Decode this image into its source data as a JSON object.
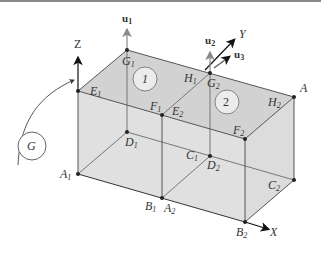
{
  "diagram": {
    "type": "3D box with two cells and coordinate axes",
    "axes": {
      "x": "X",
      "y": "Y",
      "z": "Z"
    },
    "vectors": {
      "u1": "u",
      "u1_sub": "1",
      "u2": "u",
      "u2_sub": "2",
      "u3": "u",
      "u3_sub": "3"
    },
    "rotation_label": "G",
    "cells": [
      "1",
      "2"
    ],
    "points": {
      "A": {
        "main": "A",
        "sub": ""
      },
      "A1": {
        "main": "A",
        "sub": "1"
      },
      "A2": {
        "main": "A",
        "sub": "2"
      },
      "B1": {
        "main": "B",
        "sub": "1"
      },
      "B2": {
        "main": "B",
        "sub": "2"
      },
      "C1": {
        "main": "C",
        "sub": "1"
      },
      "C2": {
        "main": "C",
        "sub": "2"
      },
      "D1": {
        "main": "D",
        "sub": "1"
      },
      "D2": {
        "main": "D",
        "sub": "2"
      },
      "E1": {
        "main": "E",
        "sub": "1"
      },
      "E2": {
        "main": "E",
        "sub": "2"
      },
      "F1": {
        "main": "F",
        "sub": "1"
      },
      "F2": {
        "main": "F",
        "sub": "2"
      },
      "G1": {
        "main": "G",
        "sub": "1"
      },
      "G2": {
        "main": "G",
        "sub": "2"
      },
      "H1": {
        "main": "H",
        "sub": "1"
      },
      "H2": {
        "main": "H",
        "sub": "2"
      }
    },
    "colors": {
      "fill_top": "#d6d6d6",
      "fill_side": "#e2e2e2",
      "line": "#555555",
      "arrow": "#111111",
      "vector_arrow": "#888888"
    }
  }
}
